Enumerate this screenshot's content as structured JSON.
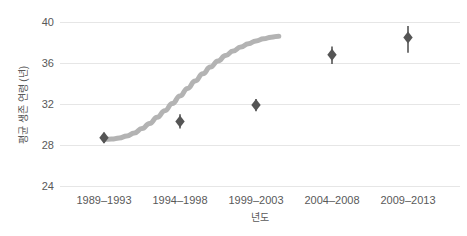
{
  "chart_data": {
    "type": "scatter",
    "title": "",
    "xlabel": "년도",
    "ylabel": "평균 생존 연령 (년)",
    "categories": [
      "1989–1993",
      "1994–1998",
      "1999–2003",
      "2004–2008",
      "2009–2013"
    ],
    "values": [
      28.7,
      30.3,
      31.9,
      36.8,
      38.5
    ],
    "error_low": [
      28.2,
      29.6,
      31.3,
      35.9,
      37.0
    ],
    "error_high": [
      29.2,
      31.0,
      32.5,
      37.6,
      39.6
    ],
    "error_bars": true,
    "trendline": {
      "type": "smoothed-sigmoid",
      "color": "#b3b3b3",
      "width": 5,
      "points": [
        [
          0.0,
          28.55
        ],
        [
          0.1,
          28.58
        ],
        [
          0.2,
          28.68
        ],
        [
          0.3,
          28.88
        ],
        [
          0.4,
          29.18
        ],
        [
          0.5,
          29.6
        ],
        [
          0.6,
          30.1
        ],
        [
          0.7,
          30.7
        ],
        [
          0.8,
          31.35
        ],
        [
          0.9,
          32.05
        ],
        [
          1.0,
          32.78
        ],
        [
          1.1,
          33.52
        ],
        [
          1.2,
          34.25
        ],
        [
          1.3,
          34.95
        ],
        [
          1.4,
          35.6
        ],
        [
          1.5,
          36.2
        ],
        [
          1.6,
          36.72
        ],
        [
          1.7,
          37.18
        ],
        [
          1.8,
          37.56
        ],
        [
          1.9,
          37.88
        ],
        [
          2.0,
          38.15
        ],
        [
          2.1,
          38.36
        ],
        [
          2.2,
          38.52
        ],
        [
          2.3,
          38.62
        ]
      ]
    },
    "ylim": [
      24,
      40
    ],
    "yticks": [
      40,
      36,
      32,
      28,
      24
    ],
    "ytick_labels": [
      "40",
      "36",
      "32",
      "28",
      "24"
    ],
    "grid": "horizontal",
    "legend": null,
    "marker": {
      "shape": "diamond",
      "color": "#555555",
      "size": 9
    },
    "background": "#ffffff",
    "gridline_color": "#e6e6e6",
    "text_color": "#595959"
  }
}
